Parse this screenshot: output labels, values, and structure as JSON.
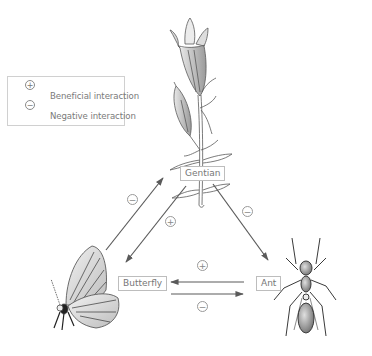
{
  "legend": {
    "items": [
      {
        "symbol": "+",
        "label": "Beneficial interaction"
      },
      {
        "symbol": "−",
        "label": "Negative interaction"
      }
    ]
  },
  "nodes": {
    "gentian": {
      "label": "Gentian",
      "illustration": "gentian-flower"
    },
    "butterfly": {
      "label": "Butterfly",
      "illustration": "butterfly"
    },
    "ant": {
      "label": "Ant",
      "illustration": "ant"
    }
  },
  "interactions": [
    {
      "from": "Butterfly",
      "to": "Gentian",
      "symbol": "−"
    },
    {
      "from": "Gentian",
      "to": "Butterfly",
      "symbol": "+"
    },
    {
      "from": "Gentian",
      "to": "Ant",
      "symbol": "−"
    },
    {
      "from": "Ant",
      "to": "Butterfly",
      "symbol": "+"
    },
    {
      "from": "Butterfly",
      "to": "Ant",
      "symbol": "−"
    }
  ],
  "colors": {
    "arrow": "#5a5a5a",
    "box_border": "#bdbdbd",
    "text": "#777777"
  }
}
